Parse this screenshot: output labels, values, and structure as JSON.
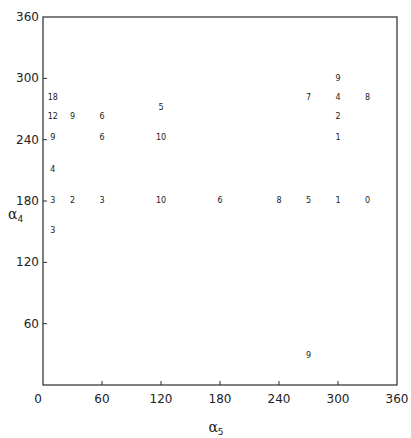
{
  "chart_data": {
    "type": "scatter",
    "title": "",
    "xlabel": "α5",
    "ylabel": "α4",
    "xlim": [
      0,
      360
    ],
    "ylim": [
      0,
      360
    ],
    "x_ticks": [
      0,
      60,
      120,
      180,
      240,
      300,
      360
    ],
    "y_ticks": [
      60,
      120,
      180,
      240,
      300,
      360
    ],
    "grid": false,
    "legend": null,
    "marker": "numeric label (count) placed at each point",
    "points": [
      {
        "x": 10,
        "y": 282,
        "label": "18"
      },
      {
        "x": 10,
        "y": 263,
        "label": "12"
      },
      {
        "x": 10,
        "y": 243,
        "label": "9"
      },
      {
        "x": 10,
        "y": 211,
        "label": "4"
      },
      {
        "x": 10,
        "y": 181,
        "label": "3"
      },
      {
        "x": 10,
        "y": 152,
        "label": "3"
      },
      {
        "x": 30,
        "y": 263,
        "label": "9"
      },
      {
        "x": 30,
        "y": 181,
        "label": "2"
      },
      {
        "x": 60,
        "y": 263,
        "label": "6"
      },
      {
        "x": 60,
        "y": 243,
        "label": "6"
      },
      {
        "x": 60,
        "y": 181,
        "label": "3"
      },
      {
        "x": 120,
        "y": 272,
        "label": "5"
      },
      {
        "x": 120,
        "y": 243,
        "label": "10"
      },
      {
        "x": 120,
        "y": 181,
        "label": "10"
      },
      {
        "x": 180,
        "y": 181,
        "label": "6"
      },
      {
        "x": 240,
        "y": 181,
        "label": "8"
      },
      {
        "x": 270,
        "y": 282,
        "label": "7"
      },
      {
        "x": 270,
        "y": 181,
        "label": "5"
      },
      {
        "x": 270,
        "y": 29,
        "label": "9"
      },
      {
        "x": 300,
        "y": 300,
        "label": "9"
      },
      {
        "x": 300,
        "y": 282,
        "label": "4"
      },
      {
        "x": 300,
        "y": 263,
        "label": "2"
      },
      {
        "x": 300,
        "y": 243,
        "label": "1"
      },
      {
        "x": 300,
        "y": 181,
        "label": "1"
      },
      {
        "x": 330,
        "y": 282,
        "label": "8"
      },
      {
        "x": 330,
        "y": 181,
        "label": "0"
      }
    ]
  },
  "axes": {
    "x_title_main": "α",
    "x_title_sub": "5",
    "y_title_main": "α",
    "y_title_sub": "4"
  },
  "style": {
    "axis_color": "#2a2a2a",
    "text_color": "#1a1a1a",
    "background": "#ffffff"
  }
}
